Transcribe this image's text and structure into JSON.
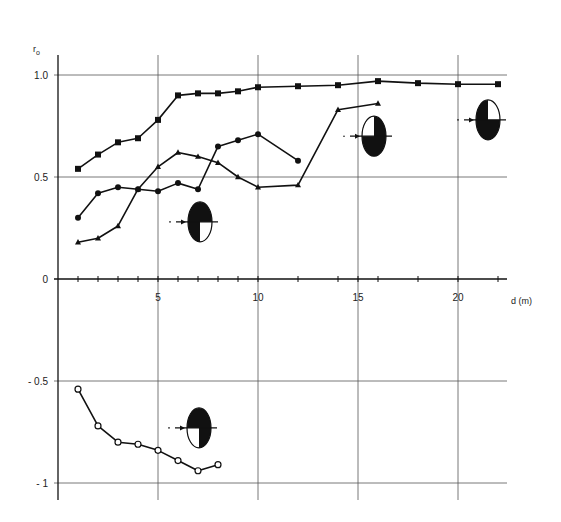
{
  "chart_data": {
    "type": "line",
    "title": "",
    "xlabel": "d (m)",
    "ylabel": "r0",
    "xlim": [
      0,
      22.5
    ],
    "ylim": [
      -1.1,
      1.1
    ],
    "grid": true,
    "x_gridlines": [
      5,
      10,
      15,
      20
    ],
    "y_gridlines": [
      1.0,
      0.5,
      0,
      -0.5,
      -1
    ],
    "x_ticks_minor": [
      1,
      2,
      3,
      4,
      5,
      6,
      7,
      8,
      9,
      10,
      12,
      14,
      15,
      16,
      18,
      20,
      22
    ],
    "x_tick_labels": [
      {
        "value": 5,
        "label": "5"
      },
      {
        "value": 10,
        "label": "10"
      },
      {
        "value": 15,
        "label": "15"
      },
      {
        "value": 20,
        "label": "20"
      }
    ],
    "y_tick_labels": [
      {
        "value": 1.0,
        "label": "1.0"
      },
      {
        "value": 0.5,
        "label": "0.5"
      },
      {
        "value": 0,
        "label": "0"
      },
      {
        "value": -0.5,
        "label": "- 0.5"
      },
      {
        "value": -1,
        "label": "- 1"
      }
    ],
    "series": [
      {
        "name": "series-1",
        "marker": "filled-square",
        "x": [
          1,
          2,
          3,
          4,
          5,
          6,
          7,
          8,
          9,
          10,
          12,
          14,
          16,
          18,
          20,
          22
        ],
        "values": [
          0.54,
          0.61,
          0.67,
          0.69,
          0.78,
          0.9,
          0.91,
          0.91,
          0.92,
          0.94,
          0.945,
          0.95,
          0.97,
          0.96,
          0.955,
          0.955
        ]
      },
      {
        "name": "series-2",
        "marker": "filled-circle",
        "x": [
          1,
          2,
          3,
          4,
          5,
          6,
          7,
          8,
          9,
          10,
          12
        ],
        "values": [
          0.3,
          0.42,
          0.45,
          0.44,
          0.43,
          0.47,
          0.44,
          0.65,
          0.68,
          0.71,
          0.58
        ]
      },
      {
        "name": "series-3",
        "marker": "filled-triangle",
        "x": [
          1,
          2,
          3,
          4,
          5,
          6,
          7,
          8,
          9,
          10,
          12,
          14,
          16
        ],
        "values": [
          0.18,
          0.2,
          0.26,
          0.44,
          0.55,
          0.62,
          0.6,
          0.57,
          0.5,
          0.45,
          0.46,
          0.83,
          0.86
        ]
      },
      {
        "name": "series-4",
        "marker": "open-circle",
        "x": [
          1,
          2,
          3,
          4,
          5,
          6,
          7,
          8
        ],
        "values": [
          -0.54,
          -0.72,
          -0.8,
          -0.81,
          -0.84,
          -0.89,
          -0.94,
          -0.91
        ]
      }
    ],
    "annotations": [
      {
        "type": "ellipse-quadrant-icon",
        "x": 7.1,
        "y": 0.28,
        "white_quadrant": "bottom-right"
      },
      {
        "type": "ellipse-quadrant-icon",
        "x": 15.8,
        "y": 0.7,
        "white_quadrant": "top-left"
      },
      {
        "type": "ellipse-quadrant-icon",
        "x": 21.5,
        "y": 0.78,
        "white_quadrant": "top-right"
      },
      {
        "type": "ellipse-quadrant-icon",
        "x": 7.05,
        "y": -0.73,
        "white_quadrant": "bottom-left"
      }
    ]
  }
}
